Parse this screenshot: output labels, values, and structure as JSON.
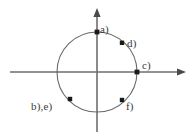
{
  "figure": {
    "background_color": "#ffffff",
    "axis_color": "#6e6e6e",
    "circle_color": "#6a6a6a",
    "point_color": "#1a1a1a",
    "label_color": "#3a3a3a"
  },
  "axes": {
    "x_axis": {
      "name": "horizontal-axis",
      "from_x": 10,
      "to_x": 186,
      "y": 72,
      "arrow": "right"
    },
    "y_axis": {
      "name": "vertical-axis",
      "x": 97,
      "from_y": 132,
      "to_y": 8,
      "arrow": "up"
    }
  },
  "circle": {
    "name": "unit-circle",
    "center_x": 97,
    "center_y": 72,
    "radius": 40
  },
  "points": [
    {
      "id": "a",
      "label": "a)",
      "x": 97,
      "y": 32,
      "angle_deg": 90
    },
    {
      "id": "d",
      "label": "d)",
      "x": 122,
      "y": 43,
      "angle_deg": 55
    },
    {
      "id": "c",
      "label": "c)",
      "x": 137,
      "y": 72,
      "angle_deg": 0
    },
    {
      "id": "f",
      "label": "f)",
      "x": 122,
      "y": 100,
      "angle_deg": -55
    },
    {
      "id": "be",
      "label": "b),e)",
      "x": 70,
      "y": 99,
      "angle_deg": 222
    }
  ]
}
